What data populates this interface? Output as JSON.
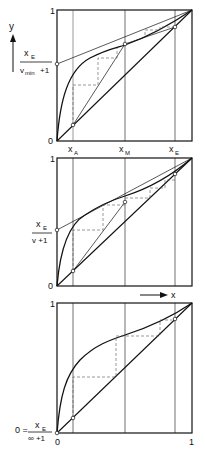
{
  "axes": {
    "y_label": "y",
    "x_label": "x",
    "tick_one": "1",
    "tick_zero": "0"
  },
  "panel1": {
    "x_ticks": {
      "xA": "x",
      "xA_sub": "A",
      "xM": "x",
      "xM_sub": "M",
      "xE": "x",
      "xE_sub": "E"
    },
    "intercept_num": "x",
    "intercept_num_sub": "E",
    "intercept_den": "v",
    "intercept_den_sub": "min",
    "intercept_den_tail": "+1"
  },
  "panel2": {
    "intercept_num": "x",
    "intercept_num_sub": "E",
    "intercept_den": "v +1"
  },
  "panel3": {
    "intercept_prefix": "0 =",
    "intercept_num": "x",
    "intercept_num_sub": "E",
    "intercept_den": "∞ +1",
    "x_tick_0": "0",
    "x_tick_1": "1"
  },
  "colors": {
    "line": "#111111",
    "dash": "#555555"
  }
}
